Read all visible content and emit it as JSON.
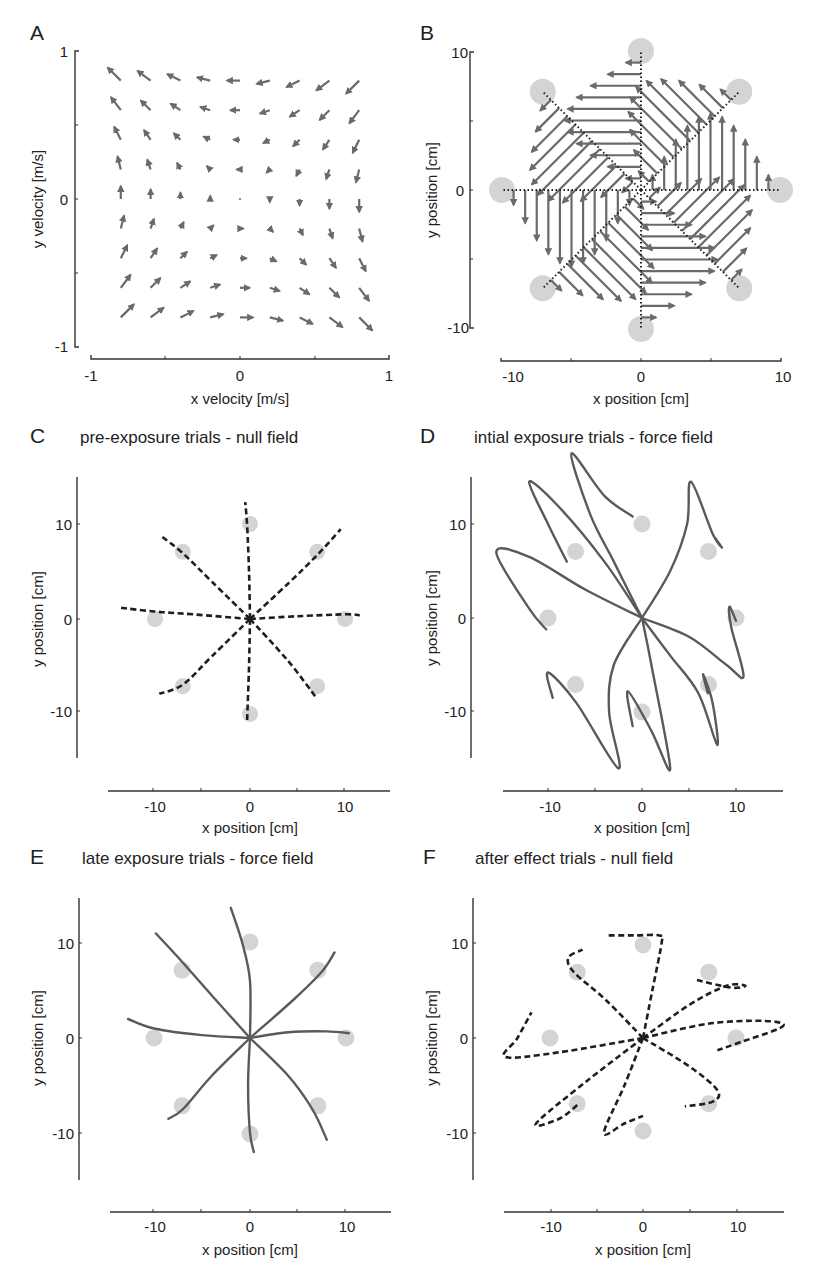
{
  "figure": {
    "panels": [
      {
        "letter": "A",
        "title": "",
        "xlabel": "x velocity [m/s]",
        "ylabel": "y velocity [m/s]",
        "xticks": [
          "-1",
          "0",
          "1"
        ],
        "yticks": [
          "1",
          "0",
          "-1"
        ]
      },
      {
        "letter": "B",
        "title": "",
        "xlabel": "x position [cm]",
        "ylabel": "y position [cm]",
        "xticks": [
          "-10",
          "0",
          "10"
        ],
        "yticks": [
          "10",
          "0",
          "-10"
        ]
      },
      {
        "letter": "C",
        "title": "pre-exposure trials - null field",
        "xlabel": "x position [cm]",
        "ylabel": "y position [cm]",
        "xticks": [
          "-10",
          "0",
          "10"
        ],
        "yticks": [
          "10",
          "0",
          "-10"
        ]
      },
      {
        "letter": "D",
        "title": "intial exposure trials - force field",
        "xlabel": "x position [cm]",
        "ylabel": "y position [cm]",
        "xticks": [
          "-10",
          "0",
          "10"
        ],
        "yticks": [
          "10",
          "0",
          "-10"
        ]
      },
      {
        "letter": "E",
        "title": "late exposure trials - force field",
        "xlabel": "x position [cm]",
        "ylabel": "y position [cm]",
        "xticks": [
          "-10",
          "0",
          "10"
        ],
        "yticks": [
          "10",
          "0",
          "-10"
        ]
      },
      {
        "letter": "F",
        "title": "after effect trials - null field",
        "xlabel": "x position [cm]",
        "ylabel": "y position [cm]",
        "xticks": [
          "-10",
          "0",
          "10"
        ],
        "yticks": [
          "10",
          "0",
          "-10"
        ]
      }
    ]
  },
  "chart_data": [
    {
      "panel": "A",
      "type": "quiver",
      "title": "",
      "xlabel": "x velocity [m/s]",
      "ylabel": "y velocity [m/s]",
      "xlim": [
        -1,
        1
      ],
      "ylim": [
        -1,
        1
      ],
      "description": "Curl (viscous) force field: force = B * velocity, rotating velocity vectors clockwise; arrows on a 9x9 grid from -0.8 to 0.8",
      "grid_x": [
        -0.8,
        -0.6,
        -0.4,
        -0.2,
        0,
        0.2,
        0.4,
        0.6,
        0.8
      ],
      "grid_y": [
        -0.8,
        -0.6,
        -0.4,
        -0.2,
        0,
        0.2,
        0.4,
        0.6,
        0.8
      ],
      "field": "F = [[0, 13], [-13, 0]] * v (shown as rotation of velocity by -90 deg)"
    },
    {
      "panel": "B",
      "type": "quiver",
      "title": "",
      "xlabel": "x position [cm]",
      "ylabel": "y position [cm]",
      "xlim": [
        -10,
        10
      ],
      "ylim": [
        -10,
        10
      ],
      "targets": [
        [
          0,
          10
        ],
        [
          7.07,
          7.07
        ],
        [
          10,
          0
        ],
        [
          7.07,
          -7.07
        ],
        [
          0,
          -10
        ],
        [
          -7.07,
          -7.07
        ],
        [
          -10,
          0
        ],
        [
          -7.07,
          7.07
        ]
      ],
      "reach_paths": "straight dotted lines from center (0,0) to each of 8 targets",
      "description": "Force vectors experienced along straight reaches; perpendicular to movement direction, largest at mid-reach"
    },
    {
      "panel": "C",
      "type": "line",
      "title": "pre-exposure trials - null field",
      "xlabel": "x position [cm]",
      "ylabel": "y position [cm]",
      "xlim": [
        -15,
        15
      ],
      "ylim": [
        -15,
        15
      ],
      "style": "dashed black",
      "targets": [
        [
          0,
          10
        ],
        [
          7.07,
          7.07
        ],
        [
          10,
          0
        ],
        [
          7.07,
          -7.07
        ],
        [
          0,
          -10
        ],
        [
          -7.07,
          -7.07
        ],
        [
          -10,
          0
        ],
        [
          -7.07,
          7.07
        ]
      ],
      "series": [
        {
          "name": "to N",
          "x": [
            0,
            -0.1,
            -0.3,
            -0.5
          ],
          "y": [
            0,
            5,
            10,
            12.5
          ]
        },
        {
          "name": "to NE",
          "x": [
            0,
            4,
            7,
            9.5
          ],
          "y": [
            0,
            3.8,
            6.8,
            9.6
          ]
        },
        {
          "name": "to E",
          "x": [
            0,
            5,
            10,
            11.5
          ],
          "y": [
            0,
            0.3,
            0.5,
            0.4
          ]
        },
        {
          "name": "to SE",
          "x": [
            0,
            4,
            7
          ],
          "y": [
            0,
            -4.5,
            -8.5
          ]
        },
        {
          "name": "to S",
          "x": [
            0,
            -0.1,
            -0.3
          ],
          "y": [
            0,
            -5,
            -10.8
          ]
        },
        {
          "name": "to SW",
          "x": [
            0,
            -4,
            -7,
            -9.5
          ],
          "y": [
            0,
            -4,
            -7,
            -8
          ]
        },
        {
          "name": "to W",
          "x": [
            0,
            -6,
            -10,
            -13.5
          ],
          "y": [
            0,
            0.5,
            0.8,
            1.2
          ]
        },
        {
          "name": "to NW",
          "x": [
            0,
            -4,
            -7,
            -9.2
          ],
          "y": [
            0,
            4,
            7,
            8.8
          ]
        }
      ]
    },
    {
      "panel": "D",
      "type": "line",
      "title": "intial exposure trials - force field",
      "xlabel": "x position [cm]",
      "ylabel": "y position [cm]",
      "xlim": [
        -15,
        15
      ],
      "ylim": [
        -15,
        15
      ],
      "style": "solid gray",
      "targets": [
        [
          0,
          10
        ],
        [
          7.07,
          7.07
        ],
        [
          10,
          0
        ],
        [
          7.07,
          -7.07
        ],
        [
          0,
          -10
        ],
        [
          -7.07,
          -7.07
        ],
        [
          -10,
          0
        ],
        [
          -7.07,
          7.07
        ]
      ],
      "series": [
        {
          "name": "to N",
          "x": [
            0,
            -3,
            -5.5,
            -7.5,
            -4,
            -1
          ],
          "y": [
            0,
            6,
            11,
            17.5,
            13,
            10.8
          ]
        },
        {
          "name": "to NE",
          "x": [
            0,
            3,
            4.8,
            5.2,
            7.5,
            8.5,
            7.8
          ],
          "y": [
            0,
            5,
            10,
            14.5,
            9,
            7.5,
            8.5
          ]
        },
        {
          "name": "to E",
          "x": [
            0,
            5,
            9,
            10.8,
            9.5,
            9.3,
            10
          ],
          "y": [
            0,
            -2,
            -5,
            -6.2,
            -1,
            1.2,
            -0.3
          ]
        },
        {
          "name": "to SE",
          "x": [
            0,
            3,
            6,
            8,
            7.5,
            6.5,
            7
          ],
          "y": [
            0,
            -4,
            -8,
            -13.5,
            -9,
            -6,
            -8
          ]
        },
        {
          "name": "to S",
          "x": [
            0,
            1,
            3,
            1,
            -1.5,
            -1
          ],
          "y": [
            0,
            -5,
            -16,
            -12,
            -7.8,
            -11.5
          ]
        },
        {
          "name": "to SW",
          "x": [
            0,
            -3,
            -3.5,
            -2.5,
            -7,
            -10,
            -9.5
          ],
          "y": [
            0,
            -5,
            -10,
            -16,
            -9,
            -5.8,
            -8.5
          ]
        },
        {
          "name": "to W",
          "x": [
            0,
            -6,
            -12,
            -15.5,
            -12,
            -10.2
          ],
          "y": [
            0,
            3,
            6.5,
            7,
            1,
            -1.2
          ]
        },
        {
          "name": "to NW",
          "x": [
            0,
            -4,
            -9,
            -12,
            -10,
            -8
          ],
          "y": [
            0,
            6,
            12,
            14.5,
            10,
            6
          ]
        }
      ]
    },
    {
      "panel": "E",
      "type": "line",
      "title": "late exposure trials - force field",
      "xlabel": "x position [cm]",
      "ylabel": "y position [cm]",
      "xlim": [
        -15,
        15
      ],
      "ylim": [
        -15,
        15
      ],
      "style": "solid gray",
      "targets": [
        [
          0,
          10
        ],
        [
          7.07,
          7.07
        ],
        [
          10,
          0
        ],
        [
          7.07,
          -7.07
        ],
        [
          0,
          -10
        ],
        [
          -7.07,
          -7.07
        ],
        [
          -10,
          0
        ],
        [
          -7.07,
          7.07
        ]
      ],
      "series": [
        {
          "name": "to N",
          "x": [
            0,
            0,
            -0.8,
            -2
          ],
          "y": [
            0,
            6,
            10,
            13.7
          ]
        },
        {
          "name": "to NE",
          "x": [
            0,
            4.5,
            7.5,
            8.8
          ],
          "y": [
            0,
            4,
            7,
            9
          ]
        },
        {
          "name": "to E",
          "x": [
            0,
            4,
            8,
            10.3
          ],
          "y": [
            0,
            0.6,
            0.7,
            0.5
          ]
        },
        {
          "name": "to SE",
          "x": [
            0,
            4,
            6.5,
            8
          ],
          "y": [
            0,
            -4,
            -7.5,
            -10.7
          ]
        },
        {
          "name": "to S",
          "x": [
            0,
            -0.2,
            0,
            0.4
          ],
          "y": [
            0,
            -5,
            -10,
            -12
          ]
        },
        {
          "name": "to SW",
          "x": [
            0,
            -4,
            -7,
            -8.5
          ],
          "y": [
            0,
            -4,
            -7.5,
            -8.5
          ]
        },
        {
          "name": "to W",
          "x": [
            0,
            -5,
            -10,
            -12.7
          ],
          "y": [
            0,
            0.3,
            1,
            2
          ]
        },
        {
          "name": "to NW",
          "x": [
            0,
            -4,
            -7.5,
            -9.8
          ],
          "y": [
            0,
            4.5,
            8.5,
            11
          ]
        }
      ]
    },
    {
      "panel": "F",
      "type": "line",
      "title": "after effect trials - null field",
      "xlabel": "x position [cm]",
      "ylabel": "y position [cm]",
      "xlim": [
        -15,
        15
      ],
      "ylim": [
        -15,
        15
      ],
      "style": "dashed black",
      "targets": [
        [
          0,
          10
        ],
        [
          7.07,
          7.07
        ],
        [
          10,
          0
        ],
        [
          7.07,
          -7.07
        ],
        [
          0,
          -10
        ],
        [
          -7.07,
          -7.07
        ],
        [
          -10,
          0
        ],
        [
          -7.07,
          7.07
        ]
      ],
      "series": [
        {
          "name": "to N",
          "x": [
            0,
            1,
            2,
            1.8,
            -1,
            -4
          ],
          "y": [
            0,
            5,
            10,
            10.8,
            10.8,
            10.8
          ]
        },
        {
          "name": "to NE",
          "x": [
            0,
            5,
            9,
            11,
            9.5,
            5.8
          ],
          "y": [
            0,
            3.5,
            5.5,
            5.5,
            5.3,
            6.1
          ]
        },
        {
          "name": "to E",
          "x": [
            0,
            7,
            13,
            15,
            10,
            8
          ],
          "y": [
            0,
            1.5,
            1.8,
            1.2,
            -0.6,
            -1.3
          ]
        },
        {
          "name": "to SE",
          "x": [
            0,
            5,
            8,
            7.5,
            4.5
          ],
          "y": [
            0,
            -3,
            -5.5,
            -6.7,
            -7.2
          ]
        },
        {
          "name": "to S",
          "x": [
            0,
            -2,
            -4.2,
            -2,
            0
          ],
          "y": [
            0,
            -5,
            -10,
            -9,
            -8.2
          ]
        },
        {
          "name": "to SW",
          "x": [
            0,
            -6,
            -11.5,
            -9,
            -7
          ],
          "y": [
            0,
            -4.5,
            -9,
            -8.5,
            -7
          ]
        },
        {
          "name": "to W",
          "x": [
            0,
            -9,
            -14.8,
            -13.5,
            -12
          ],
          "y": [
            0,
            -1.5,
            -2,
            0,
            2.7
          ]
        },
        {
          "name": "to NW",
          "x": [
            0,
            -4,
            -7.5,
            -8,
            -6.5
          ],
          "y": [
            0,
            4,
            7,
            8.5,
            9.3
          ]
        }
      ]
    }
  ]
}
